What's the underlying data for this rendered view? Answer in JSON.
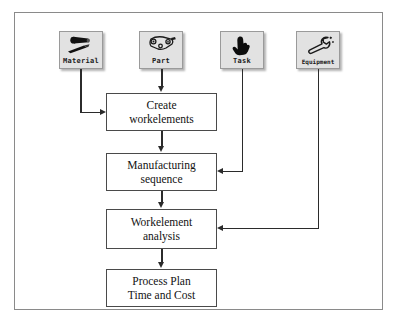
{
  "diagram": {
    "sources": [
      {
        "id": "material",
        "label": "Material",
        "icon": "material-bar-icon",
        "x": 58,
        "y": 30
      },
      {
        "id": "part",
        "label": "Part",
        "icon": "part-bracket-icon",
        "x": 138,
        "y": 30
      },
      {
        "id": "task",
        "label": "Task",
        "icon": "pointing-hand-icon",
        "x": 219,
        "y": 30
      },
      {
        "id": "equipment",
        "label": "Equipment",
        "icon": "wrench-icon",
        "x": 295,
        "y": 30
      }
    ],
    "steps": [
      {
        "id": "create-workelements",
        "line1": "Create",
        "line2": "workelements",
        "x": 105,
        "y": 92,
        "w": 111,
        "h": 38
      },
      {
        "id": "manufacturing-sequence",
        "line1": "Manufacturing",
        "line2": "sequence",
        "x": 105,
        "y": 152,
        "w": 111,
        "h": 38
      },
      {
        "id": "workelement-analysis",
        "line1": "Workelement",
        "line2": "analysis",
        "x": 105,
        "y": 208,
        "w": 111,
        "h": 40
      },
      {
        "id": "process-plan",
        "line1": "Process Plan",
        "line2": "Time and Cost",
        "x": 105,
        "y": 268,
        "w": 111,
        "h": 38
      }
    ],
    "connections": [
      {
        "from": "material",
        "to": "create-workelements",
        "route": "down-then-right"
      },
      {
        "from": "part",
        "to": "create-workelements",
        "route": "straight-down"
      },
      {
        "from": "task",
        "to": "manufacturing-sequence",
        "route": "down-then-left"
      },
      {
        "from": "equipment",
        "to": "workelement-analysis",
        "route": "down-then-left"
      },
      {
        "from": "create-workelements",
        "to": "manufacturing-sequence",
        "route": "straight-down"
      },
      {
        "from": "manufacturing-sequence",
        "to": "workelement-analysis",
        "route": "straight-down"
      },
      {
        "from": "workelement-analysis",
        "to": "process-plan",
        "route": "straight-down"
      }
    ],
    "colors": {
      "frame_border": "#8a8a8a",
      "box_border": "#4a4a4a",
      "connector": "#2b2b2b",
      "tile_fill": "#e2e2e2",
      "background": "#ffffff"
    }
  }
}
